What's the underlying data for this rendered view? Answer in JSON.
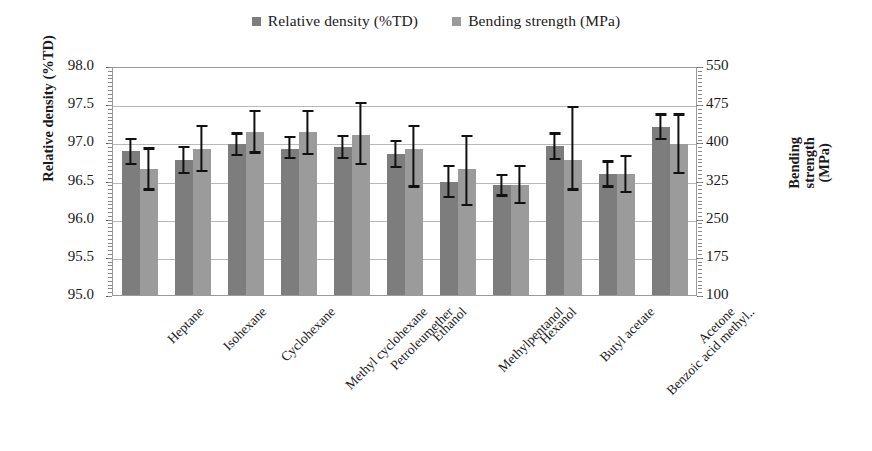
{
  "chart_data": {
    "type": "bar",
    "title": "",
    "xlabel": "",
    "ylabel": "Relative density (%TD)",
    "y2label": "Bending strength (MPa)",
    "ylim": [
      95.0,
      98.0
    ],
    "y2lim": [
      100,
      550
    ],
    "yticks": [
      "98.0",
      "97.5",
      "97.0",
      "96.5",
      "96.0",
      "95.5",
      "95.0"
    ],
    "y2ticks": [
      "550",
      "475",
      "400",
      "325",
      "250",
      "175",
      "100"
    ],
    "grid": true,
    "legend_position": "top-center",
    "categories": [
      "Heptane",
      "Isohexane",
      "Cyclohexane",
      "Methyl cyclohexane",
      "Petroleumether",
      "Ethanol",
      "Methylpentanol",
      "Hexanol",
      "Butyl acetate",
      "Benzoic acid methyl..",
      "Acetone"
    ],
    "series": [
      {
        "name": "Relative density (%TD)",
        "color": "#7d7d7d",
        "axis": "left",
        "values": [
          96.9,
          96.78,
          97.0,
          96.93,
          96.95,
          96.87,
          96.5,
          96.45,
          96.97,
          96.6,
          97.22
        ],
        "err_low": [
          96.72,
          96.6,
          96.84,
          96.8,
          96.8,
          96.68,
          96.28,
          96.3,
          96.78,
          96.42,
          97.05
        ],
        "err_high": [
          97.08,
          96.97,
          97.15,
          97.1,
          97.12,
          97.05,
          96.72,
          96.6,
          97.15,
          96.78,
          97.4
        ]
      },
      {
        "name": "Bending strength (MPa)",
        "color": "#9b9b9b",
        "axis": "right",
        "values": [
          96.67,
          96.93,
          97.15,
          97.15,
          97.12,
          96.93,
          96.67,
          96.45,
          96.78,
          96.6,
          97.0
        ],
        "err_low": [
          96.38,
          96.62,
          96.87,
          96.85,
          96.72,
          96.42,
          96.18,
          96.2,
          96.38,
          96.35,
          96.6
        ],
        "err_high": [
          96.95,
          97.25,
          97.45,
          97.45,
          97.55,
          97.25,
          97.12,
          96.72,
          97.5,
          96.85,
          97.4
        ]
      }
    ]
  },
  "legend": {
    "items": [
      {
        "label": "Relative density (%TD)",
        "color": "#7d7d7d"
      },
      {
        "label": "Bending strength (MPa)",
        "color": "#9b9b9b"
      }
    ]
  },
  "axes": {
    "left_title": "Relative density (%TD)",
    "right_title_line1": "Bending",
    "right_title_line2": "strength",
    "right_title_line3": "(MPa)"
  }
}
